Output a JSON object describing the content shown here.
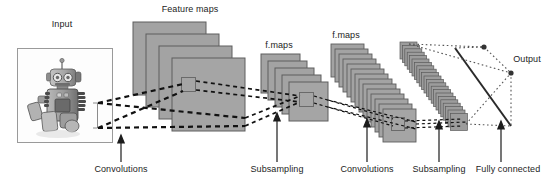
{
  "figure": {
    "background_color": "#ffffff",
    "width": 556,
    "height": 182
  },
  "colors": {
    "map_fill": "#a3a3a3",
    "map_fill_dark": "#8f8f8f",
    "map_stroke": "#5e5e5e",
    "connector": "#111111",
    "text": "#1c1c1c",
    "input_box_stroke": "#9a9a9a",
    "output_dot": "#333333"
  },
  "labels": {
    "input": "Input",
    "feature_maps": "Feature maps",
    "f_maps_1": "f.maps",
    "f_maps_2": "f.maps",
    "output": "Output",
    "convolutions_1": "Convolutions",
    "subsampling_1": "Subsampling",
    "convolutions_2": "Convolutions",
    "subsampling_2": "Subsampling",
    "fully_connected": "Fully connected"
  },
  "stages": [
    {
      "name": "input",
      "label": "Input",
      "kind": "image",
      "count": 1
    },
    {
      "name": "conv1",
      "label": "Feature maps",
      "kind": "stack",
      "count": 4,
      "operation": "Convolutions"
    },
    {
      "name": "pool1",
      "label": "f.maps",
      "kind": "stack",
      "count": 5,
      "operation": "Subsampling"
    },
    {
      "name": "conv2",
      "label": "f.maps",
      "kind": "stack",
      "count": 14,
      "operation": "Convolutions"
    },
    {
      "name": "pool2",
      "label": "",
      "kind": "stack",
      "count": 26,
      "operation": "Subsampling"
    },
    {
      "name": "output",
      "label": "Output",
      "kind": "nodes",
      "count": 2,
      "operation": "Fully connected"
    }
  ],
  "input_image": {
    "alt": "Toy robot photograph",
    "caption": "Input"
  }
}
